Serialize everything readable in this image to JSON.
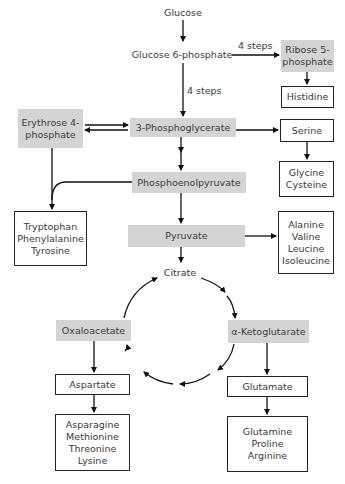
{
  "diagram": {
    "nodes": {
      "glucose": "Glucose",
      "g6p": "Glucose 6-phosphate",
      "ribose5p": "Ribose 5-\nphosphate",
      "histidine": "Histidine",
      "erythrose4p": "Erythrose 4-\nphosphate",
      "pg3": "3-Phosphoglycerate",
      "serine": "Serine",
      "glycine_cysteine": "Glycine\nCysteine",
      "pep": "Phosphoenolpyruvate",
      "aromatic": "Tryptophan\nPhenylalanine\nTyrosine",
      "pyruvate": "Pyruvate",
      "pyruvate_family": "Alanine\nValine\nLeucine\nIsoleucine",
      "citrate": "Citrate",
      "oxaloacetate": "Oxaloacetate",
      "akg": "α-Ketoglutarate",
      "aspartate": "Aspartate",
      "aspartate_family": "Asparagine\nMethionine\nThreonine\nLysine",
      "glutamate": "Glutamate",
      "glutamate_family": "Glutamine\nProline\nArginine"
    },
    "edge_labels": {
      "g6p_to_ribose": "4 steps",
      "g6p_to_3pg": "4 steps"
    },
    "colors": {
      "shaded_box": "#d4d4d4",
      "border": "#222222",
      "text": "#3a3a3a"
    }
  }
}
